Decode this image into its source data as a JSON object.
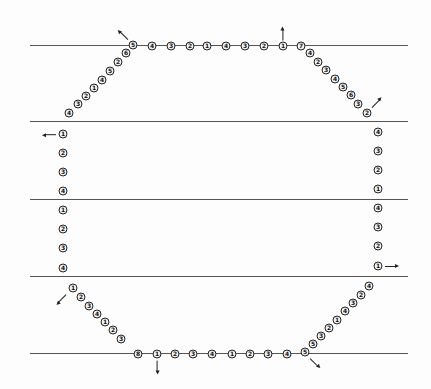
{
  "diagram": {
    "type": "octagonal marker layout",
    "lines": [
      {
        "y": 45,
        "x1": 30,
        "x2": 408
      },
      {
        "y": 121,
        "x1": 30,
        "x2": 408
      },
      {
        "y": 199,
        "x1": 30,
        "x2": 408
      },
      {
        "y": 276,
        "x1": 30,
        "x2": 408
      },
      {
        "y": 353,
        "x1": 30,
        "x2": 408
      }
    ],
    "markers": [
      {
        "x": 133,
        "y": 45,
        "label": "5"
      },
      {
        "x": 152,
        "y": 46,
        "label": "4"
      },
      {
        "x": 171,
        "y": 46,
        "label": "3"
      },
      {
        "x": 190,
        "y": 46,
        "label": "2"
      },
      {
        "x": 207,
        "y": 46,
        "label": "1"
      },
      {
        "x": 226,
        "y": 46,
        "label": "4"
      },
      {
        "x": 245,
        "y": 46,
        "label": "3"
      },
      {
        "x": 264,
        "y": 46,
        "label": "2"
      },
      {
        "x": 283,
        "y": 46,
        "label": "1"
      },
      {
        "x": 301,
        "y": 46,
        "label": "7"
      },
      {
        "x": 126,
        "y": 53,
        "label": "6"
      },
      {
        "x": 118,
        "y": 62,
        "label": "2"
      },
      {
        "x": 110,
        "y": 71,
        "label": "5"
      },
      {
        "x": 102,
        "y": 80,
        "label": "4"
      },
      {
        "x": 94,
        "y": 88,
        "label": "1"
      },
      {
        "x": 86,
        "y": 96,
        "label": "2"
      },
      {
        "x": 78,
        "y": 104,
        "label": "3"
      },
      {
        "x": 69,
        "y": 113,
        "label": "4"
      },
      {
        "x": 310,
        "y": 53,
        "label": "4"
      },
      {
        "x": 318,
        "y": 62,
        "label": "2"
      },
      {
        "x": 326,
        "y": 70,
        "label": "3"
      },
      {
        "x": 335,
        "y": 79,
        "label": "4"
      },
      {
        "x": 343,
        "y": 87,
        "label": "5"
      },
      {
        "x": 351,
        "y": 95,
        "label": "6"
      },
      {
        "x": 358,
        "y": 104,
        "label": "3"
      },
      {
        "x": 367,
        "y": 113,
        "label": "2"
      },
      {
        "x": 63,
        "y": 134,
        "label": "1"
      },
      {
        "x": 63,
        "y": 153,
        "label": "2"
      },
      {
        "x": 63,
        "y": 172,
        "label": "3"
      },
      {
        "x": 63,
        "y": 191,
        "label": "4"
      },
      {
        "x": 63,
        "y": 210,
        "label": "1"
      },
      {
        "x": 63,
        "y": 229,
        "label": "2"
      },
      {
        "x": 63,
        "y": 248,
        "label": "3"
      },
      {
        "x": 63,
        "y": 268,
        "label": "4"
      },
      {
        "x": 378,
        "y": 132,
        "label": "4"
      },
      {
        "x": 378,
        "y": 151,
        "label": "3"
      },
      {
        "x": 378,
        "y": 170,
        "label": "2"
      },
      {
        "x": 378,
        "y": 189,
        "label": "1"
      },
      {
        "x": 378,
        "y": 208,
        "label": "4"
      },
      {
        "x": 378,
        "y": 227,
        "label": "3"
      },
      {
        "x": 378,
        "y": 246,
        "label": "2"
      },
      {
        "x": 378,
        "y": 266,
        "label": "1"
      },
      {
        "x": 73,
        "y": 288,
        "label": "1"
      },
      {
        "x": 81,
        "y": 297,
        "label": "2"
      },
      {
        "x": 89,
        "y": 306,
        "label": "3"
      },
      {
        "x": 97,
        "y": 314,
        "label": "4"
      },
      {
        "x": 105,
        "y": 322,
        "label": "1"
      },
      {
        "x": 113,
        "y": 330,
        "label": "2"
      },
      {
        "x": 121,
        "y": 339,
        "label": "3"
      },
      {
        "x": 138,
        "y": 354,
        "label": "8"
      },
      {
        "x": 157,
        "y": 354,
        "label": "1"
      },
      {
        "x": 175,
        "y": 354,
        "label": "2"
      },
      {
        "x": 193,
        "y": 354,
        "label": "3"
      },
      {
        "x": 212,
        "y": 354,
        "label": "4"
      },
      {
        "x": 232,
        "y": 354,
        "label": "1"
      },
      {
        "x": 250,
        "y": 354,
        "label": "2"
      },
      {
        "x": 268,
        "y": 354,
        "label": "3"
      },
      {
        "x": 287,
        "y": 354,
        "label": "4"
      },
      {
        "x": 305,
        "y": 352,
        "label": "5"
      },
      {
        "x": 313,
        "y": 344,
        "label": "5"
      },
      {
        "x": 321,
        "y": 336,
        "label": "3"
      },
      {
        "x": 329,
        "y": 328,
        "label": "2"
      },
      {
        "x": 337,
        "y": 320,
        "label": "1"
      },
      {
        "x": 345,
        "y": 311,
        "label": "4"
      },
      {
        "x": 353,
        "y": 303,
        "label": "3"
      },
      {
        "x": 361,
        "y": 295,
        "label": "2"
      },
      {
        "x": 369,
        "y": 286,
        "label": "4"
      }
    ],
    "arrows": [
      {
        "x": 128,
        "y": 39,
        "angle": -135,
        "name": "up-left"
      },
      {
        "x": 283,
        "y": 40,
        "angle": -90,
        "name": "up"
      },
      {
        "x": 372,
        "y": 107,
        "angle": -45,
        "name": "up-right"
      },
      {
        "x": 56,
        "y": 134,
        "angle": 180,
        "name": "left"
      },
      {
        "x": 385,
        "y": 266,
        "angle": 0,
        "name": "right"
      },
      {
        "x": 66,
        "y": 294,
        "angle": 135,
        "name": "down-left"
      },
      {
        "x": 157,
        "y": 360,
        "angle": 90,
        "name": "down"
      },
      {
        "x": 310,
        "y": 358,
        "angle": 45,
        "name": "down-right"
      }
    ]
  }
}
